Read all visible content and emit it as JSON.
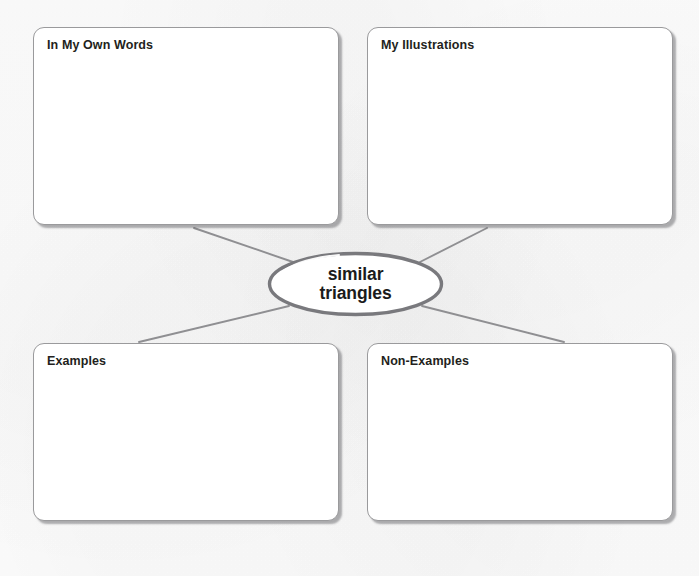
{
  "worksheet": {
    "type": "concept-map",
    "center": {
      "term_line1": "similar",
      "term_line2": "triangles"
    },
    "quadrants": [
      {
        "id": "in-my-own-words",
        "label": "In My Own Words",
        "content": ""
      },
      {
        "id": "my-illustrations",
        "label": "My Illustrations",
        "content": ""
      },
      {
        "id": "examples",
        "label": "Examples",
        "content": ""
      },
      {
        "id": "non-examples",
        "label": "Non-Examples",
        "content": ""
      }
    ],
    "colors": {
      "page_background": "#fdfdfd",
      "box_fill": "#ffffff",
      "box_border": "#9a9a9c",
      "box_shadow": "#5a5a5f",
      "connector_line": "#8f8f92",
      "ellipse_stroke": "#79797d",
      "label_text": "#231f20",
      "center_text": "#1b1b1b"
    }
  }
}
